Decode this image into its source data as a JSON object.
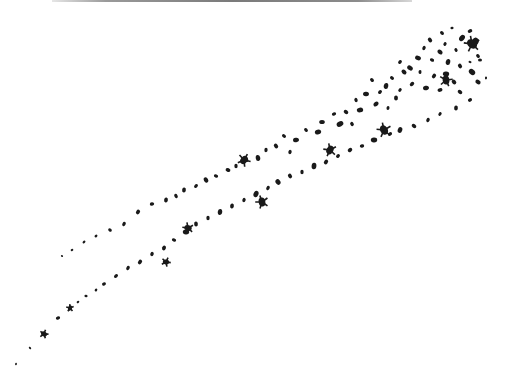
{
  "image": {
    "description": "Scanned black-and-white illustration of scattered particles forming two diagonal streaks",
    "background_color": "#ffffff",
    "ink_color": "#1a1a1a",
    "top_rule_color": "#8a8a8a",
    "streaks": [
      {
        "name": "upper-streak",
        "particles": [
          [
            442,
            33,
            2.2
          ],
          [
            452,
            28,
            1.6
          ],
          [
            470,
            31,
            2.4
          ],
          [
            462,
            38,
            3.4
          ],
          [
            430,
            40,
            2.5
          ],
          [
            445,
            44,
            2
          ],
          [
            424,
            48,
            2.2
          ],
          [
            440,
            52,
            2.8
          ],
          [
            456,
            50,
            2
          ],
          [
            475,
            42,
            4.5
          ],
          [
            478,
            56,
            2.2
          ],
          [
            470,
            62,
            1.5
          ],
          [
            418,
            58,
            3
          ],
          [
            432,
            60,
            2.2
          ],
          [
            448,
            62,
            3
          ],
          [
            460,
            66,
            2.5
          ],
          [
            472,
            72,
            3.5
          ],
          [
            478,
            82,
            2.8
          ],
          [
            486,
            78,
            1.4
          ],
          [
            410,
            68,
            3
          ],
          [
            420,
            72,
            2
          ],
          [
            434,
            76,
            2.5
          ],
          [
            446,
            74,
            3.2
          ],
          [
            454,
            82,
            2.6
          ],
          [
            400,
            62,
            2.2
          ],
          [
            404,
            72,
            2.8
          ],
          [
            392,
            78,
            2.2
          ],
          [
            412,
            84,
            2.5
          ],
          [
            426,
            88,
            3
          ],
          [
            440,
            90,
            2.5
          ],
          [
            460,
            92,
            2.5
          ],
          [
            400,
            90,
            2
          ],
          [
            386,
            86,
            3
          ],
          [
            396,
            98,
            2.6
          ],
          [
            372,
            80,
            2.2
          ],
          [
            380,
            92,
            2.2
          ],
          [
            366,
            94,
            3
          ],
          [
            376,
            104,
            2.8
          ],
          [
            388,
            108,
            2
          ],
          [
            356,
            100,
            2.2
          ],
          [
            360,
            110,
            3.2
          ],
          [
            346,
            112,
            2.5
          ],
          [
            334,
            114,
            2.2
          ],
          [
            340,
            124,
            3.5
          ],
          [
            352,
            124,
            2.2
          ],
          [
            322,
            122,
            2.8
          ],
          [
            318,
            132,
            3.2
          ],
          [
            306,
            130,
            2.2
          ],
          [
            296,
            140,
            3
          ],
          [
            284,
            136,
            2.2
          ],
          [
            276,
            146,
            2.5
          ],
          [
            290,
            152,
            2.2
          ],
          [
            266,
            150,
            2.2
          ],
          [
            258,
            158,
            3
          ],
          [
            246,
            160,
            2.5
          ],
          [
            236,
            166,
            2.2
          ],
          [
            228,
            170,
            2.5
          ],
          [
            216,
            176,
            2.2
          ],
          [
            206,
            180,
            2.8
          ],
          [
            196,
            186,
            2.2
          ],
          [
            184,
            190,
            2.5
          ],
          [
            176,
            196,
            2.2
          ],
          [
            166,
            200,
            2.5
          ],
          [
            152,
            204,
            2.2
          ],
          [
            138,
            212,
            2.5
          ],
          [
            124,
            224,
            2.2
          ],
          [
            110,
            230,
            2
          ],
          [
            96,
            236,
            1.6
          ],
          [
            84,
            242,
            1.6
          ],
          [
            72,
            250,
            1.4
          ],
          [
            62,
            256,
            1.2
          ]
        ]
      },
      {
        "name": "lower-streak",
        "particles": [
          [
            480,
            60,
            2
          ],
          [
            470,
            100,
            2.2
          ],
          [
            456,
            108,
            2.5
          ],
          [
            440,
            114,
            2
          ],
          [
            428,
            120,
            2.2
          ],
          [
            414,
            126,
            2.5
          ],
          [
            400,
            130,
            3
          ],
          [
            390,
            134,
            2.2
          ],
          [
            374,
            140,
            3.2
          ],
          [
            362,
            146,
            2.2
          ],
          [
            350,
            150,
            2.5
          ],
          [
            338,
            156,
            2.2
          ],
          [
            326,
            162,
            2.5
          ],
          [
            314,
            166,
            3.2
          ],
          [
            302,
            172,
            2.2
          ],
          [
            290,
            176,
            2.5
          ],
          [
            278,
            182,
            3
          ],
          [
            268,
            188,
            2.2
          ],
          [
            256,
            194,
            3.2
          ],
          [
            244,
            200,
            2.2
          ],
          [
            232,
            206,
            2.5
          ],
          [
            220,
            212,
            3
          ],
          [
            208,
            218,
            2.2
          ],
          [
            196,
            224,
            2.5
          ],
          [
            186,
            232,
            3.2
          ],
          [
            174,
            240,
            2.2
          ],
          [
            164,
            248,
            2.5
          ],
          [
            152,
            254,
            2.2
          ],
          [
            140,
            262,
            2.5
          ],
          [
            128,
            268,
            2.2
          ],
          [
            116,
            276,
            2.2
          ],
          [
            104,
            284,
            2
          ],
          [
            96,
            290,
            1.6
          ],
          [
            86,
            296,
            1.6
          ],
          [
            78,
            302,
            1.4
          ],
          [
            70,
            308,
            2.4
          ],
          [
            58,
            318,
            2.2
          ],
          [
            44,
            334,
            2.8
          ],
          [
            30,
            348,
            1.4
          ],
          [
            16,
            364,
            1.2
          ]
        ]
      }
    ],
    "large_blots": [
      [
        472,
        44,
        5.5
      ],
      [
        446,
        80,
        4.5
      ],
      [
        384,
        130,
        5
      ],
      [
        330,
        150,
        4.5
      ],
      [
        244,
        160,
        4.5
      ],
      [
        262,
        202,
        4.5
      ],
      [
        188,
        228,
        3.8
      ],
      [
        166,
        262,
        3.2
      ],
      [
        44,
        334,
        3
      ],
      [
        70,
        308,
        2.6
      ]
    ]
  }
}
